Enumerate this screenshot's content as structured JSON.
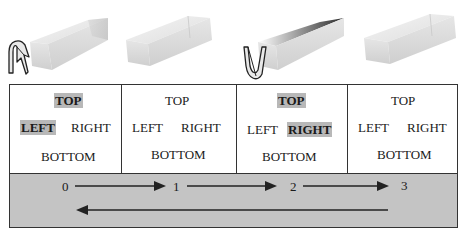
{
  "figure": {
    "beams": [
      {
        "index": 0,
        "twist_icon": "twist-arrow-left",
        "state": "twisting"
      },
      {
        "index": 1,
        "twist_icon": null,
        "state": "straight"
      },
      {
        "index": 2,
        "twist_icon": "twist-arrow-right",
        "state": "twisting"
      },
      {
        "index": 3,
        "twist_icon": null,
        "state": "straight"
      }
    ],
    "cells": [
      {
        "top": "TOP",
        "left": "LEFT",
        "right": "RIGHT",
        "bottom": "BOTTOM",
        "highlighted": [
          "TOP",
          "LEFT"
        ]
      },
      {
        "top": "TOP",
        "left": "LEFT",
        "right": "RIGHT",
        "bottom": "BOTTOM",
        "highlighted": []
      },
      {
        "top": "TOP",
        "left": "LEFT",
        "right": "RIGHT",
        "bottom": "BOTTOM",
        "highlighted": [
          "TOP",
          "RIGHT"
        ]
      },
      {
        "top": "TOP",
        "left": "LEFT",
        "right": "RIGHT",
        "bottom": "BOTTOM",
        "highlighted": []
      }
    ],
    "states": [
      "0",
      "1",
      "2",
      "3"
    ],
    "colors": {
      "highlight": "#b8b8b8",
      "band": "#c4c4c4",
      "border": "#333333"
    }
  }
}
